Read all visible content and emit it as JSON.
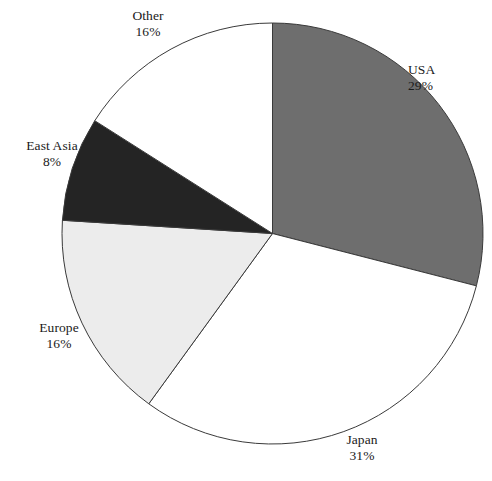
{
  "chart_data": {
    "type": "pie",
    "title": "",
    "categories": [
      "USA",
      "Japan",
      "Europe",
      "East Asia",
      "Other"
    ],
    "values": [
      29,
      31,
      16,
      8,
      16
    ],
    "value_labels": [
      "29%",
      "31%",
      "16%",
      "8%",
      "16%"
    ],
    "unit": "%",
    "start_angle_deg": 0,
    "direction": "clockwise",
    "legend": "none",
    "labels_position": "outside",
    "slices": [
      {
        "name": "USA",
        "value": 29,
        "value_label": "29%",
        "color": "#6e6e6e",
        "stroke": "#3a3a3a"
      },
      {
        "name": "Japan",
        "value": 31,
        "value_label": "31%",
        "color": "#ffffff",
        "stroke": "#3a3a3a"
      },
      {
        "name": "Europe",
        "value": 16,
        "value_label": "16%",
        "color": "#ececec",
        "stroke": "#3a3a3a"
      },
      {
        "name": "East Asia",
        "value": 8,
        "value_label": "8%",
        "color": "#242424",
        "stroke": "#3a3a3a"
      },
      {
        "name": "Other",
        "value": 16,
        "value_label": "16%",
        "color": "#ffffff",
        "stroke": "#3a3a3a"
      }
    ]
  },
  "labels": {
    "usa": {
      "name": "USA",
      "value": "29%"
    },
    "japan": {
      "name": "Japan",
      "value": "31%"
    },
    "europe": {
      "name": "Europe",
      "value": "16%"
    },
    "east_asia": {
      "name": "East Asia",
      "value": "8%"
    },
    "other": {
      "name": "Other",
      "value": "16%"
    }
  },
  "colors": {
    "background": "#ffffff",
    "outline": "#3a3a3a",
    "text": "#1a1a1a",
    "usa_fill": "#6e6e6e",
    "japan_fill": "#ffffff",
    "europe_fill": "#ececec",
    "east_asia_fill": "#242424",
    "other_fill": "#ffffff"
  }
}
